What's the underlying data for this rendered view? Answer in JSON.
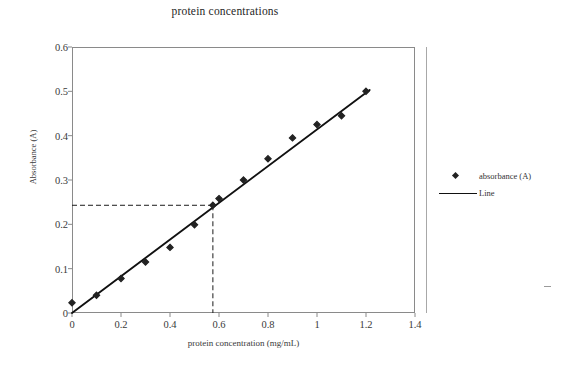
{
  "chart_data": {
    "type": "scatter",
    "title": "protein concentrations",
    "xlabel": "protein concentration (mg/mL)",
    "ylabel": "Absorbance (A)",
    "xlim": [
      0,
      1.4
    ],
    "ylim": [
      0,
      0.6
    ],
    "xticks": [
      "0",
      "0.2",
      "0.4",
      "0.6",
      "0.8",
      "1",
      "1.2",
      "1.4"
    ],
    "xtick_values": [
      0,
      0.2,
      0.4,
      0.6,
      0.8,
      1.0,
      1.2,
      1.4
    ],
    "yticks": [
      "0",
      "0.1",
      "0.2",
      "0.3",
      "0.4",
      "0.5",
      "0.6"
    ],
    "ytick_values": [
      0,
      0.1,
      0.2,
      0.3,
      0.4,
      0.5,
      0.6
    ],
    "grid": false,
    "legend_position": "right",
    "series": [
      {
        "name": "absorbance (A)",
        "marker": "diamond",
        "color": "#222222",
        "x": [
          0,
          0.1,
          0.2,
          0.3,
          0.4,
          0.5,
          0.575,
          0.6,
          0.7,
          0.8,
          0.9,
          1.0,
          1.1,
          1.2
        ],
        "values": [
          0.023,
          0.04,
          0.078,
          0.115,
          0.148,
          0.199,
          0.243,
          0.258,
          0.3,
          0.348,
          0.395,
          0.425,
          0.445,
          0.5
        ]
      },
      {
        "name": "Line",
        "marker": "line",
        "color": "#111111",
        "fit_x": [
          0,
          1.215
        ],
        "fit_y": [
          0.0,
          0.503
        ]
      }
    ],
    "annotations": [
      {
        "type": "dashed-guide",
        "x": 0.575,
        "y": 0.243,
        "description": "dashed lines from y-axis to curve and down to x-axis"
      }
    ]
  },
  "legend": {
    "items": [
      {
        "label": "absorbance (A)",
        "symbol": "diamond-marker"
      },
      {
        "label": "Line",
        "symbol": "line-swatch"
      }
    ]
  }
}
